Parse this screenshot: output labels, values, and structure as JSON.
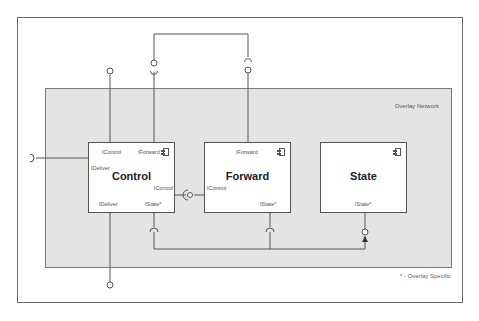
{
  "diagram": {
    "container": {
      "label": "Overlay Network"
    },
    "footnote": "* - Overlay Specific",
    "components": [
      {
        "name": "Control",
        "ports": {
          "top_left": "IControl",
          "top_right": "IForward",
          "left": "IDeliver",
          "right": "IControl",
          "bottom_left": "IDeliver",
          "bottom_right": "IState*"
        }
      },
      {
        "name": "Forward",
        "ports": {
          "top": "IForward",
          "left": "IControl",
          "bottom_right": "IState*"
        }
      },
      {
        "name": "State",
        "ports": {
          "bottom": "IState*"
        }
      }
    ],
    "colors": {
      "container_fill": "#e4e4e4",
      "line": "#555555",
      "box_fill": "#ffffff"
    }
  }
}
